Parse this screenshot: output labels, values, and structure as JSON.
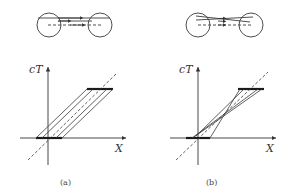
{
  "figure": {
    "panels": [
      {
        "id": "a",
        "caption": "(a)",
        "y_axis_label": "cT",
        "x_axis_label": "X",
        "description": "Parallel worldlines: light signal strip between two mirrors translated diagonally"
      },
      {
        "id": "b",
        "caption": "(b)",
        "y_axis_label": "cT",
        "x_axis_label": "X",
        "description": "Crossing worldlines converging through a point"
      }
    ],
    "colors": {
      "stroke": "#3a3a3a",
      "thick_bar": "#1a1a1a",
      "background": "#ffffff"
    }
  }
}
